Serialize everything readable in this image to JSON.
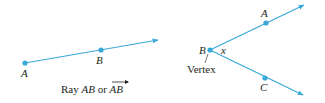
{
  "colors": {
    "ray": "#3aa8d8",
    "point": "#3aa8d8",
    "text": "#231f20"
  },
  "ray_figure": {
    "point_a_label": "A",
    "point_b_label": "B",
    "caption_prefix": "Ray ",
    "caption_ab": "AB",
    "caption_or": " or ",
    "caption_vector": "AB"
  },
  "angle_figure": {
    "vertex_label": "B",
    "angle_label": "x",
    "point_a_label": "A",
    "point_c_label": "C",
    "vertex_caption": "Vertex"
  }
}
